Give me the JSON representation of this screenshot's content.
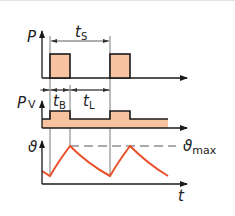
{
  "diagram": {
    "colors": {
      "fill": "#f7c2a0",
      "stroke": "#1a1a1a",
      "curve": "#e8502a",
      "dimension": "#333333",
      "dashed": "#444444"
    },
    "panels": {
      "power": {
        "axis_label": "P",
        "dimension_label": "t",
        "dimension_sub": "S"
      },
      "losses": {
        "axis_label": "P",
        "axis_sub": "V",
        "dim1_label": "t",
        "dim1_sub": "B",
        "dim2_label": "t",
        "dim2_sub": "L"
      },
      "temperature": {
        "axis_label": "ϑ",
        "max_label": "ϑ",
        "max_sub": "max",
        "time_label": "t"
      }
    }
  }
}
